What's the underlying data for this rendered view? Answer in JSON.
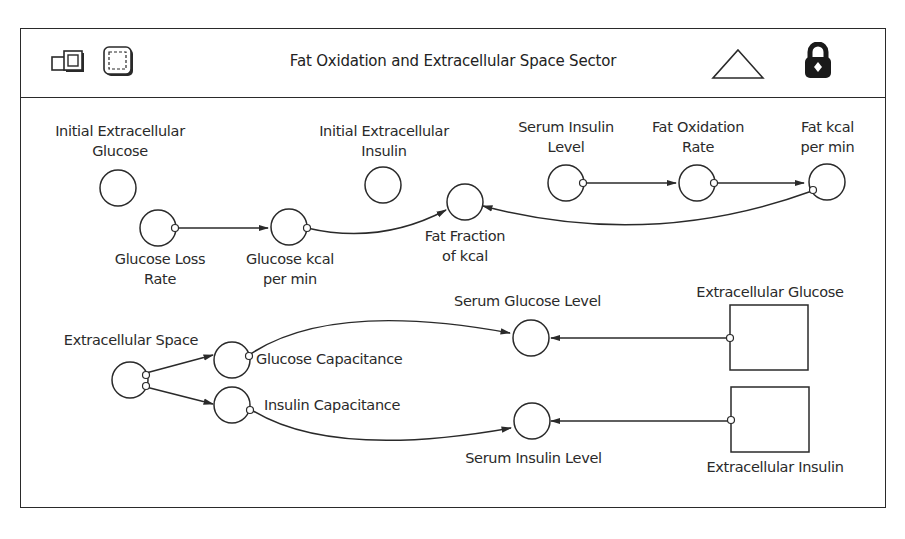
{
  "header": {
    "title": "Fat Oxidation and Extracellular Space Sector",
    "icons": [
      "model-layer-icon",
      "map-layer-icon",
      "up-level-triangle-icon",
      "lock-icon"
    ]
  },
  "diagram": {
    "converters": [
      {
        "id": "initial_extracellular_glucose",
        "label_lines": [
          "Initial Extracellular",
          "Glucose"
        ]
      },
      {
        "id": "glucose_loss_rate",
        "label_lines": [
          "Glucose Loss",
          "Rate"
        ]
      },
      {
        "id": "glucose_kcal_per_min",
        "label_lines": [
          "Glucose kcal",
          "per min"
        ]
      },
      {
        "id": "initial_extracellular_insulin",
        "label_lines": [
          "Initial Extracellular",
          "Insulin"
        ]
      },
      {
        "id": "fat_fraction_of_kcal",
        "label_lines": [
          "Fat Fraction",
          "of kcal"
        ]
      },
      {
        "id": "serum_insulin_level_top",
        "label_lines": [
          "Serum Insulin",
          "Level"
        ]
      },
      {
        "id": "fat_oxidation_rate",
        "label_lines": [
          "Fat Oxidation",
          "Rate"
        ]
      },
      {
        "id": "fat_kcal_per_min",
        "label_lines": [
          "Fat kcal",
          "per min"
        ]
      },
      {
        "id": "extracellular_space",
        "label_lines": [
          "Extracellular Space"
        ]
      },
      {
        "id": "glucose_capacitance",
        "label_lines": [
          "Glucose Capacitance"
        ]
      },
      {
        "id": "insulin_capacitance",
        "label_lines": [
          "Insulin Capacitance"
        ]
      },
      {
        "id": "serum_glucose_level",
        "label_lines": [
          "Serum Glucose Level"
        ]
      },
      {
        "id": "serum_insulin_level_bottom",
        "label_lines": [
          "Serum Insulin Level"
        ]
      }
    ],
    "stocks": [
      {
        "id": "extracellular_glucose",
        "label": "Extracellular Glucose"
      },
      {
        "id": "extracellular_insulin",
        "label": "Extracellular Insulin"
      }
    ],
    "connectors": [
      {
        "from": "Glucose Loss Rate",
        "to": "Glucose kcal per min"
      },
      {
        "from": "Glucose kcal per min",
        "to": "Fat Fraction of kcal"
      },
      {
        "from": "Fat kcal per min",
        "to": "Fat Fraction of kcal"
      },
      {
        "from": "Serum Insulin Level",
        "to": "Fat Oxidation Rate"
      },
      {
        "from": "Fat Oxidation Rate",
        "to": "Fat kcal per min"
      },
      {
        "from": "Extracellular Space",
        "to": "Glucose Capacitance"
      },
      {
        "from": "Extracellular Space",
        "to": "Insulin Capacitance"
      },
      {
        "from": "Glucose Capacitance",
        "to": "Serum Glucose Level"
      },
      {
        "from": "Insulin Capacitance",
        "to": "Serum Insulin Level"
      },
      {
        "from": "Extracellular Glucose",
        "to": "Serum Glucose Level"
      },
      {
        "from": "Extracellular Insulin",
        "to": "Serum Insulin Level"
      }
    ]
  },
  "labels": {
    "initial_extracellular_glucose_1": "Initial Extracellular",
    "initial_extracellular_glucose_2": "Glucose",
    "glucose_loss_rate_1": "Glucose Loss",
    "glucose_loss_rate_2": "Rate",
    "glucose_kcal_per_min_1": "Glucose kcal",
    "glucose_kcal_per_min_2": "per min",
    "initial_extracellular_insulin_1": "Initial Extracellular",
    "initial_extracellular_insulin_2": "Insulin",
    "fat_fraction_of_kcal_1": "Fat Fraction",
    "fat_fraction_of_kcal_2": "of kcal",
    "serum_insulin_level_top_1": "Serum Insulin",
    "serum_insulin_level_top_2": "Level",
    "fat_oxidation_rate_1": "Fat Oxidation",
    "fat_oxidation_rate_2": "Rate",
    "fat_kcal_per_min_1": "Fat kcal",
    "fat_kcal_per_min_2": "per min",
    "extracellular_space": "Extracellular Space",
    "glucose_capacitance": "Glucose Capacitance",
    "insulin_capacitance": "Insulin Capacitance",
    "serum_glucose_level": "Serum Glucose Level",
    "serum_insulin_level_bottom": "Serum Insulin Level",
    "extracellular_glucose": "Extracellular Glucose",
    "extracellular_insulin": "Extracellular Insulin"
  },
  "colors": {
    "stroke": "#2a2a2a",
    "background": "#ffffff"
  }
}
